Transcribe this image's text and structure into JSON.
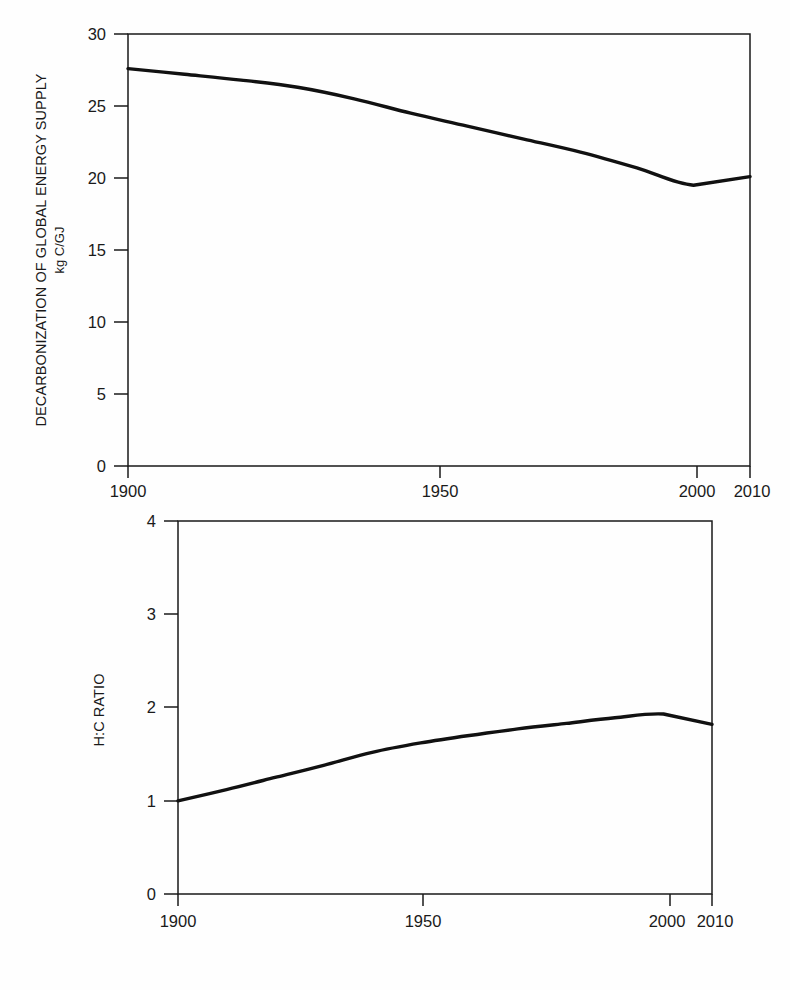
{
  "page": {
    "background_color": "#fefefe",
    "line_color": "#111111",
    "axis_color": "#1a1a1a"
  },
  "chart_data": [
    {
      "id": "decarbonization",
      "type": "line",
      "title": "",
      "ylabel": "DECARBONIZATION OF GLOBAL ENERGY SUPPLY",
      "ylabel_units": "kg C/GJ",
      "xlabel": "",
      "xlim": [
        1900,
        2010
      ],
      "ylim": [
        0,
        30
      ],
      "yticks": [
        0,
        5,
        10,
        15,
        20,
        25,
        30
      ],
      "ytick_labels": [
        "0",
        "5",
        "10",
        "15",
        "20",
        "25",
        "30"
      ],
      "xticks": [
        1900,
        1950,
        2000,
        2010
      ],
      "xtick_labels": [
        "1900",
        "1950",
        "2000",
        "2010"
      ],
      "grid": false,
      "legend": false,
      "x": [
        1900,
        1910,
        1920,
        1930,
        1940,
        1950,
        1960,
        1970,
        1980,
        1990,
        2000,
        2010
      ],
      "values": [
        27.6,
        27.2,
        26.8,
        26.3,
        25.5,
        24.5,
        23.6,
        22.7,
        21.8,
        20.7,
        19.5,
        20.1
      ]
    },
    {
      "id": "hc-ratio",
      "type": "line",
      "title": "",
      "ylabel": "H:C RATIO",
      "xlabel": "",
      "xlim": [
        1900,
        2010
      ],
      "ylim": [
        0,
        4
      ],
      "yticks": [
        0,
        1,
        2,
        3,
        4
      ],
      "ytick_labels": [
        "0",
        "1",
        "2",
        "3",
        "4"
      ],
      "xticks": [
        1900,
        1950,
        2000,
        2010
      ],
      "xtick_labels": [
        "1900",
        "1950",
        "2000",
        "2010"
      ],
      "grid": false,
      "legend": false,
      "x": [
        1900,
        1910,
        1920,
        1930,
        1940,
        1950,
        1960,
        1970,
        1980,
        1990,
        2000,
        2010
      ],
      "values": [
        1.0,
        1.12,
        1.25,
        1.38,
        1.52,
        1.62,
        1.7,
        1.77,
        1.83,
        1.89,
        1.93,
        1.82
      ]
    }
  ],
  "charts": {
    "top": {
      "ylabel_line1": "DECARBONIZATION OF GLOBAL ENERGY SUPPLY",
      "ylabel_line2": "kg C/GJ",
      "ytick_0": "0",
      "ytick_5": "5",
      "ytick_10": "10",
      "ytick_15": "15",
      "ytick_20": "20",
      "ytick_25": "25",
      "ytick_30": "30",
      "xtick_1900": "1900",
      "xtick_1950": "1950",
      "xtick_2000": "2000",
      "xtick_2010": "2010"
    },
    "bottom": {
      "ylabel": "H:C RATIO",
      "ytick_0": "0",
      "ytick_1": "1",
      "ytick_2": "2",
      "ytick_3": "3",
      "ytick_4": "4",
      "xtick_1900": "1900",
      "xtick_1950": "1950",
      "xtick_2000": "2000",
      "xtick_2010": "2010"
    }
  }
}
